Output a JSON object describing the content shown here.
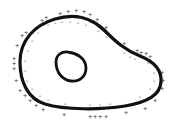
{
  "diagram": {
    "colors": {
      "background": "#ffffff",
      "membrane": "#111111",
      "charges": "#555555"
    },
    "outer_charge_symbol": "+",
    "inner_charge_symbol": "-",
    "outer_charges": [
      [
        60,
        13
      ],
      [
        68,
        11
      ],
      [
        76,
        10
      ],
      [
        84,
        11
      ],
      [
        90,
        14
      ],
      [
        42,
        20
      ],
      [
        46,
        17
      ],
      [
        26,
        32
      ],
      [
        22,
        35
      ],
      [
        17,
        45
      ],
      [
        14,
        58
      ],
      [
        14,
        63
      ],
      [
        14,
        68
      ],
      [
        16,
        80
      ],
      [
        20,
        90
      ],
      [
        25,
        95
      ],
      [
        30,
        100
      ],
      [
        36,
        105
      ],
      [
        43,
        109
      ],
      [
        64,
        114
      ],
      [
        90,
        116
      ],
      [
        95,
        116
      ],
      [
        100,
        116
      ],
      [
        106,
        116
      ],
      [
        126,
        112
      ],
      [
        145,
        108
      ],
      [
        155,
        100
      ],
      [
        162,
        88
      ],
      [
        163,
        80
      ],
      [
        162,
        72
      ],
      [
        150,
        56
      ],
      [
        146,
        53
      ],
      [
        141,
        52
      ],
      [
        137,
        50
      ],
      [
        124,
        43
      ],
      [
        106,
        27
      ],
      [
        97,
        19
      ]
    ],
    "inner_charges": [
      [
        48,
        24
      ],
      [
        55,
        22
      ],
      [
        62,
        21
      ],
      [
        70,
        21
      ],
      [
        78,
        22
      ],
      [
        86,
        24
      ],
      [
        38,
        32
      ],
      [
        32,
        40
      ],
      [
        28,
        50
      ],
      [
        25,
        60
      ],
      [
        25,
        70
      ],
      [
        27,
        80
      ],
      [
        32,
        88
      ],
      [
        40,
        95
      ],
      [
        48,
        99
      ],
      [
        65,
        103
      ],
      [
        90,
        104
      ],
      [
        100,
        104
      ],
      [
        110,
        103
      ],
      [
        140,
        96
      ],
      [
        150,
        88
      ],
      [
        154,
        80
      ],
      [
        154,
        72
      ],
      [
        148,
        62
      ],
      [
        135,
        58
      ],
      [
        130,
        56
      ],
      [
        124,
        52
      ],
      [
        106,
        36
      ],
      [
        98,
        30
      ]
    ],
    "shapes": [
      {
        "name": "cell-membrane",
        "label": "cell membrane"
      },
      {
        "name": "nucleus",
        "label": "nucleus"
      }
    ]
  }
}
